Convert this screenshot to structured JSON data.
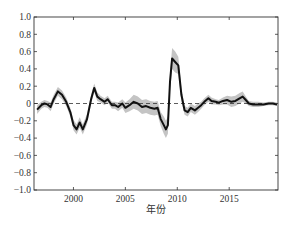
{
  "chart_data": {
    "type": "line",
    "title": "",
    "xlabel": "年份",
    "ylabel": "",
    "xlim": [
      1996.2,
      2019.7
    ],
    "ylim": [
      -1.0,
      1.0
    ],
    "x_ticks": [
      2000,
      2005,
      2010,
      2015
    ],
    "x_tick_labels": [
      "2000",
      "2005",
      "2010",
      "2015"
    ],
    "y_ticks": [
      -1.0,
      -0.8,
      -0.6,
      -0.4,
      -0.2,
      0,
      0.2,
      0.4,
      0.6,
      0.8,
      1.0
    ],
    "y_tick_labels": [
      "−1.0",
      "−0.8",
      "−0.6",
      "−0.4",
      "−0.2",
      "0",
      "0.2",
      "0.4",
      "0.6",
      "0.8",
      "1.0"
    ],
    "grid": false,
    "reference_line": {
      "y": 0,
      "style": "dashed"
    },
    "series": [
      {
        "name": "estimate",
        "style": "solid black line with grey confidence band",
        "x": [
          1996.5,
          1996.9,
          1997.2,
          1997.5,
          1997.8,
          1998.1,
          1998.5,
          1998.9,
          1999.3,
          1999.7,
          2000.0,
          2000.3,
          2000.6,
          2000.9,
          2001.3,
          2001.7,
          2002.0,
          2002.3,
          2002.6,
          2003.0,
          2003.3,
          2003.7,
          2004.0,
          2004.3,
          2004.7,
          2005.0,
          2005.4,
          2005.8,
          2006.2,
          2006.6,
          2007.0,
          2007.4,
          2007.8,
          2008.1,
          2008.4,
          2008.7,
          2008.9,
          2009.1,
          2009.3,
          2009.5,
          2009.8,
          2010.1,
          2010.4,
          2010.7,
          2011.0,
          2011.3,
          2011.7,
          2012.0,
          2012.3,
          2012.6,
          2013.0,
          2013.3,
          2013.7,
          2014.0,
          2014.4,
          2014.8,
          2015.2,
          2015.6,
          2016.0,
          2016.3,
          2016.6,
          2016.9,
          2017.3,
          2017.8,
          2018.3,
          2018.8,
          2019.2,
          2019.6
        ],
        "values": [
          -0.07,
          -0.02,
          0.0,
          -0.01,
          -0.04,
          0.05,
          0.14,
          0.1,
          0.02,
          -0.1,
          -0.25,
          -0.3,
          -0.22,
          -0.3,
          -0.18,
          0.05,
          0.18,
          0.08,
          0.05,
          0.02,
          0.05,
          -0.02,
          -0.02,
          -0.04,
          0.0,
          -0.05,
          -0.02,
          0.02,
          0.0,
          -0.04,
          -0.03,
          -0.05,
          -0.06,
          -0.05,
          -0.18,
          -0.25,
          -0.3,
          -0.25,
          0.25,
          0.52,
          0.48,
          0.44,
          0.1,
          -0.08,
          -0.1,
          -0.05,
          -0.08,
          -0.05,
          -0.02,
          0.02,
          0.06,
          0.03,
          0.02,
          0.01,
          0.03,
          0.04,
          0.02,
          0.03,
          0.06,
          0.08,
          0.04,
          0.0,
          -0.01,
          -0.01,
          -0.01,
          0.0,
          0.0,
          -0.01
        ],
        "band_halfwidth": [
          0.05,
          0.04,
          0.04,
          0.04,
          0.05,
          0.05,
          0.05,
          0.05,
          0.05,
          0.05,
          0.06,
          0.06,
          0.06,
          0.06,
          0.06,
          0.05,
          0.05,
          0.05,
          0.04,
          0.04,
          0.04,
          0.04,
          0.04,
          0.05,
          0.05,
          0.06,
          0.07,
          0.08,
          0.08,
          0.08,
          0.08,
          0.08,
          0.08,
          0.08,
          0.08,
          0.1,
          0.1,
          0.1,
          0.1,
          0.12,
          0.12,
          0.1,
          0.08,
          0.05,
          0.05,
          0.05,
          0.05,
          0.05,
          0.04,
          0.04,
          0.04,
          0.04,
          0.03,
          0.03,
          0.04,
          0.05,
          0.06,
          0.06,
          0.06,
          0.06,
          0.04,
          0.03,
          0.03,
          0.03,
          0.02,
          0.02,
          0.02,
          0.02
        ]
      }
    ],
    "note": "Series values and band widths were estimated by eye from the screenshot, not measured"
  },
  "labels": {
    "x_axis_title": "年份"
  },
  "colors": {
    "line": "#111111",
    "band": "#c4c4c4",
    "axis": "#333333",
    "zero_line": "#333333"
  }
}
